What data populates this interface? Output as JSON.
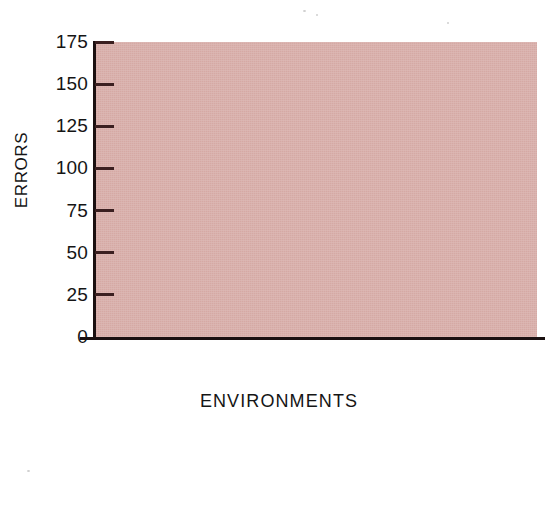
{
  "chart_data": {
    "type": "bar",
    "title": "",
    "subtitle": "",
    "xlabel": "ENVIRONMENTS",
    "ylabel": "ERRORS",
    "categories": [
      "Enriched",
      "Neutral",
      "Restricted"
    ],
    "series": [
      {
        "name": "Bright rats",
        "color": "#ffffff",
        "values": [
          110,
          117,
          170
        ]
      },
      {
        "name": "Dull rats",
        "color": "#0b0808",
        "values": [
          122,
          165,
          170
        ]
      }
    ],
    "ylim": [
      0,
      175
    ],
    "yticks": [
      0,
      25,
      50,
      75,
      100,
      125,
      150,
      175
    ],
    "ytick_labels": [
      "0",
      "25",
      "50",
      "75",
      "100",
      "125",
      "150",
      "175"
    ],
    "grid": false,
    "legend_position": "bottom-center",
    "plot_background": "#d5a9a4",
    "figure_background": "#ffffff",
    "axis_color": "#1a1011"
  },
  "axis": {
    "y_title": "ERRORS",
    "x_title": "ENVIRONMENTS"
  },
  "ticks": {
    "y": [
      {
        "label": "175",
        "value": 175
      },
      {
        "label": "150",
        "value": 150
      },
      {
        "label": "125",
        "value": 125
      },
      {
        "label": "100",
        "value": 100
      },
      {
        "label": "75",
        "value": 75
      },
      {
        "label": "50",
        "value": 50
      },
      {
        "label": "25",
        "value": 25
      },
      {
        "label": "0",
        "value": 0
      }
    ]
  },
  "categories": [
    {
      "label": "Enriched"
    },
    {
      "label": "Neutral"
    },
    {
      "label": "Restricted"
    }
  ],
  "legend": {
    "items": [
      {
        "label": "Bright rats",
        "swatch": "bright"
      },
      {
        "label": "Dull rats",
        "swatch": "dull"
      }
    ]
  }
}
